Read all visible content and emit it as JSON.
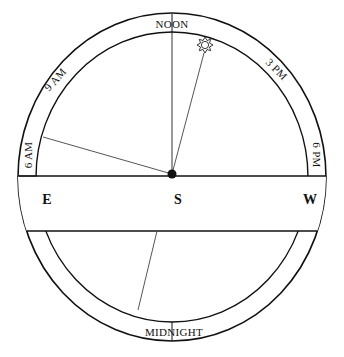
{
  "diagram": {
    "ring_labels": {
      "noon": "NOON",
      "nine_am": "9 AM",
      "three_pm": "3 PM",
      "six_am": "6 AM",
      "six_pm": "6 PM",
      "midnight": "MIDNIGHT"
    },
    "directions": {
      "east": "E",
      "south": "S",
      "west": "W"
    },
    "icons": {
      "sun": "sun-icon",
      "center": "center-dot"
    },
    "colors": {
      "stroke": "#111111",
      "ray": "#555555",
      "background": "#ffffff"
    }
  }
}
